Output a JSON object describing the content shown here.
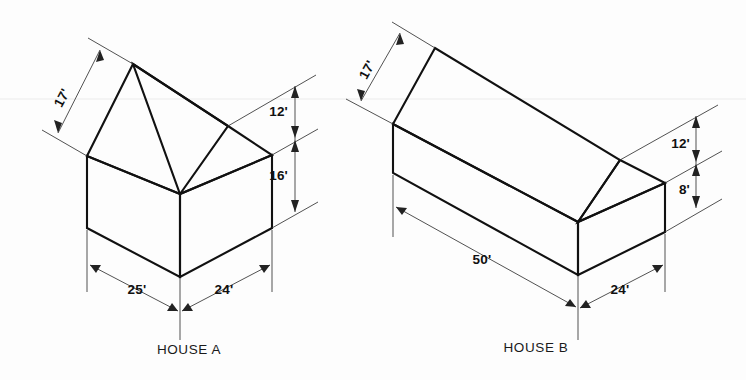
{
  "page": {
    "background_color": "#fdfdfd",
    "line_color": "#111111",
    "text_color": "#111111"
  },
  "figure": {
    "type": "isometric-technical-drawing"
  },
  "house_a": {
    "caption": "HOUSE A",
    "dimensions": {
      "roof_slope": "17'",
      "roof_height": "12'",
      "wall_height": "16'",
      "left_base": "25'",
      "right_base": "24'"
    }
  },
  "house_b": {
    "caption": "HOUSE B",
    "dimensions": {
      "roof_slope": "17'",
      "roof_height": "12'",
      "wall_height": "8'",
      "length": "50'",
      "width": "24'"
    }
  }
}
